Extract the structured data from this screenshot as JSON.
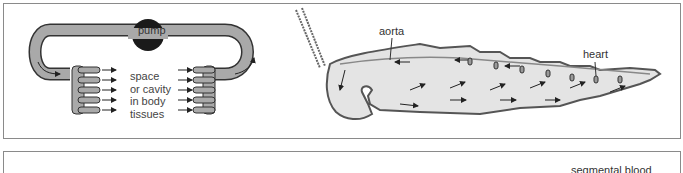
{
  "diagram": {
    "open_circulation_schematic": {
      "pump_label": "pump",
      "tissue_label_lines": [
        "space",
        "or cavity",
        "in body",
        "tissues"
      ]
    },
    "insect_circulation": {
      "labels": {
        "aorta": "aorta",
        "heart": "heart"
      }
    },
    "bottom_panel": {
      "partial_label": "segmental blood"
    }
  }
}
